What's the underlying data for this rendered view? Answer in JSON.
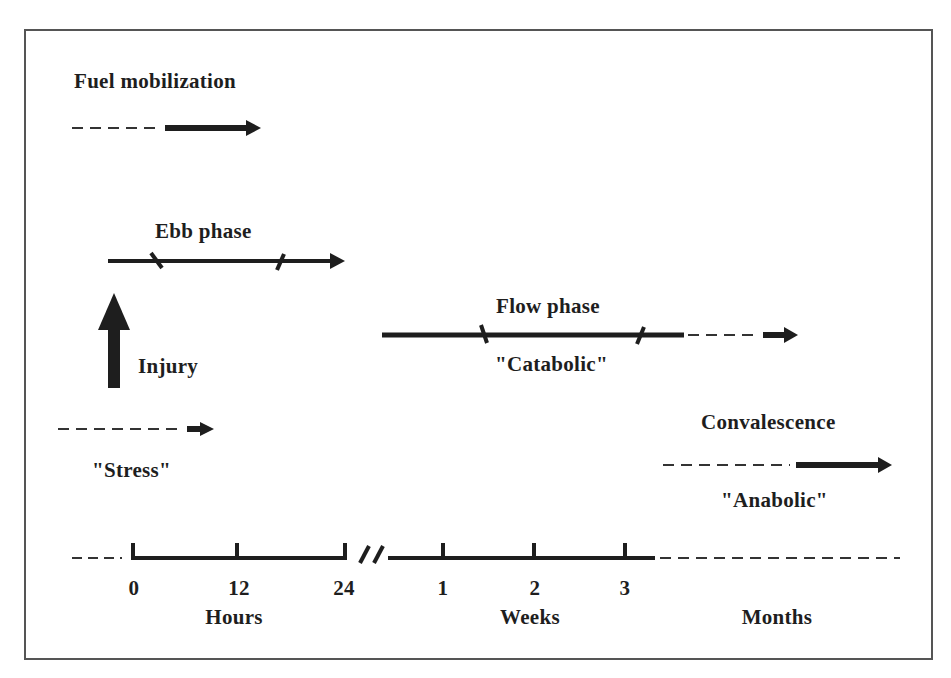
{
  "diagram": {
    "type": "timeline",
    "labels": {
      "fuel_mobilization": "Fuel  mobilization",
      "ebb_phase": "Ebb  phase",
      "injury": "Injury",
      "stress": "\"Stress\"",
      "flow_phase": "Flow  phase",
      "catabolic": "\"Catabolic\"",
      "convalescence": "Convalescence",
      "anabolic": "\"Anabolic\""
    },
    "axis": {
      "ticks": {
        "t0": "0",
        "t12": "12",
        "t24": "24",
        "w1": "1",
        "w2": "2",
        "w3": "3"
      },
      "units": {
        "hours": "Hours",
        "weeks": "Weeks",
        "months": "Months"
      }
    },
    "colors": {
      "ink": "#1e1e1e",
      "frame": "#555555"
    }
  }
}
